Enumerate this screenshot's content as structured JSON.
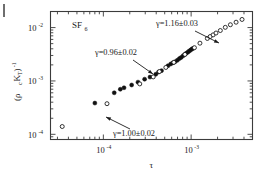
{
  "figure": {
    "background": "#ffffff",
    "frame_color": "#3b3b3b",
    "marker_color": "#111111",
    "corner_mark": "figure-corner-rule"
  },
  "chart_data": {
    "type": "scatter",
    "title": "",
    "subtitle": "",
    "sample_label": "SF",
    "sample_label_sub": "6",
    "xlabel": "τ",
    "ylabel_main": "(ρ",
    "ylabel_sub": "c",
    "ylabel_main2": "K",
    "ylabel_sub2": "T",
    "ylabel_close": ")",
    "ylabel_sup": "-1",
    "xscale": "log",
    "yscale": "log",
    "xlim": [
      2.5e-05,
      0.005
    ],
    "ylim": [
      8e-05,
      0.02
    ],
    "grid": false,
    "legend": false,
    "x_ticks": [
      {
        "value": 0.0001,
        "mantissa": "10",
        "exponent": "-4"
      },
      {
        "value": 0.001,
        "mantissa": "10",
        "exponent": "-3"
      }
    ],
    "y_ticks": [
      {
        "value": 0.01,
        "mantissa": "10",
        "exponent": "-2"
      },
      {
        "value": 0.001,
        "mantissa": "10",
        "exponent": "-3"
      },
      {
        "value": 0.0001,
        "mantissa": "10",
        "exponent": "-4"
      }
    ],
    "series": [
      {
        "name": "filled-circles",
        "marker": "filled-circle",
        "points": [
          [
            8e-05,
            0.000385
          ],
          [
            0.000133,
            0.0006
          ],
          [
            0.000156,
            0.0007
          ],
          [
            0.000172,
            0.000745
          ],
          [
            0.00021,
            0.00084
          ],
          [
            0.000248,
            0.00095
          ],
          [
            0.000295,
            0.00108
          ],
          [
            0.00034,
            0.00118
          ],
          [
            0.000395,
            0.00133
          ],
          [
            0.000425,
            0.00147
          ],
          [
            0.00046,
            0.00156
          ],
          [
            0.000545,
            0.00193
          ],
          [
            0.000585,
            0.00208
          ],
          [
            0.00062,
            0.00219
          ],
          [
            0.000655,
            0.00229
          ],
          [
            0.000695,
            0.00243
          ],
          [
            0.000735,
            0.00262
          ],
          [
            0.00077,
            0.00276
          ],
          [
            0.00081,
            0.00296
          ],
          [
            0.000845,
            0.00312
          ],
          [
            0.00088,
            0.0033
          ],
          [
            0.000915,
            0.00345
          ],
          [
            0.00095,
            0.00362
          ],
          [
            0.000985,
            0.00378
          ],
          [
            0.00102,
            0.00395
          ],
          [
            0.001055,
            0.00408
          ]
        ]
      },
      {
        "name": "open-circles",
        "marker": "open-circle",
        "points": [
          [
            3.4e-05,
            0.00014
          ],
          [
            0.00011,
            0.000375
          ],
          [
            0.00026,
            0.00088
          ],
          [
            0.00037,
            0.00119
          ],
          [
            0.000435,
            0.0015
          ],
          [
            0.000515,
            0.00179
          ],
          [
            0.000635,
            0.00223
          ],
          [
            0.00085,
            0.00314
          ],
          [
            0.00109,
            0.0042
          ],
          [
            0.00126,
            0.0051
          ],
          [
            0.00153,
            0.00625
          ],
          [
            0.00165,
            0.0068
          ],
          [
            0.00178,
            0.0073
          ],
          [
            0.00192,
            0.0079
          ],
          [
            0.00215,
            0.0088
          ],
          [
            0.00245,
            0.0101
          ],
          [
            0.0028,
            0.0113
          ],
          [
            0.00325,
            0.0126
          ],
          [
            0.0038,
            0.0142
          ]
        ]
      }
    ],
    "annotations": [
      {
        "id": "gamma-upper",
        "text": "γ=1.16±0.03",
        "text_x": 156,
        "text_y": 26,
        "arrow_from": [
          195,
          31
        ],
        "arrow_to": [
          219,
          43
        ]
      },
      {
        "id": "gamma-middle",
        "text": "γ=0.96±0.02",
        "text_x": 95,
        "text_y": 55,
        "arrow_from": [
          133,
          60
        ],
        "arrow_to": [
          153,
          74
        ]
      },
      {
        "id": "gamma-lower",
        "text": "γ=1.00±0.02",
        "text_x": 113,
        "text_y": 136,
        "arrow_from": [
          130,
          129
        ],
        "arrow_to": [
          106,
          117
        ]
      }
    ]
  }
}
